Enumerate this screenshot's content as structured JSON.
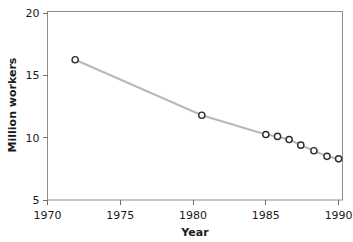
{
  "chart_data": {
    "type": "line",
    "title": "",
    "subtitle": "",
    "xlabel": "Year",
    "ylabel": "Million workers",
    "xlim": [
      1970,
      1990.3
    ],
    "ylim": [
      5,
      20.6
    ],
    "xticks": [
      1970,
      1975,
      1980,
      1985,
      1990
    ],
    "xticklabels": [
      "1970",
      "1975",
      "1980",
      "1985",
      "1990"
    ],
    "yticks": [
      5,
      10,
      15,
      20
    ],
    "yticklabels": [
      "5",
      "10",
      "15",
      "20"
    ],
    "grid": false,
    "legend": false,
    "legend_position": "none",
    "marker": "open-circle",
    "line_color": "#b9b9b9",
    "marker_edge_color": "#2b2b33",
    "marker_face_color": "#ffffff",
    "x": [
      1971.9,
      1980.6,
      1985.0,
      1985.8,
      1986.6,
      1987.4,
      1988.3,
      1989.2,
      1990.0
    ],
    "y": [
      16.25,
      11.8,
      10.25,
      10.1,
      9.85,
      9.4,
      8.95,
      8.5,
      8.3
    ],
    "points": [
      {
        "x": 1971.9,
        "y": 16.25
      },
      {
        "x": 1980.6,
        "y": 11.8
      },
      {
        "x": 1985.0,
        "y": 10.25
      },
      {
        "x": 1985.8,
        "y": 10.1
      },
      {
        "x": 1986.6,
        "y": 9.85
      },
      {
        "x": 1987.4,
        "y": 9.4
      },
      {
        "x": 1988.3,
        "y": 8.95
      },
      {
        "x": 1989.2,
        "y": 8.5
      },
      {
        "x": 1990.0,
        "y": 8.3
      }
    ],
    "series": [
      {
        "name": "Million workers",
        "x": [
          1971.9,
          1980.6,
          1985.0,
          1985.8,
          1986.6,
          1987.4,
          1988.3,
          1989.2,
          1990.0
        ],
        "values": [
          16.25,
          11.8,
          10.25,
          10.1,
          9.85,
          9.4,
          8.95,
          8.5,
          8.3
        ]
      }
    ],
    "annotations": []
  }
}
